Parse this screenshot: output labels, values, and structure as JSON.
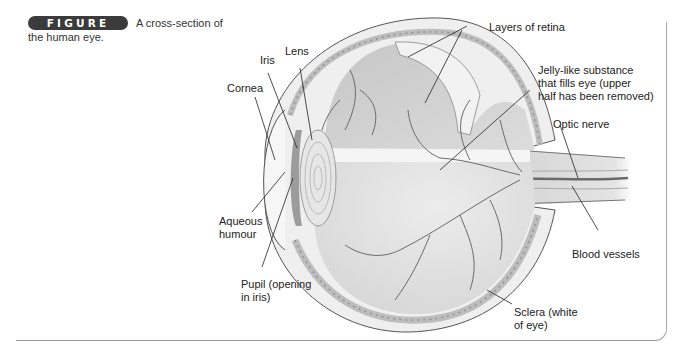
{
  "figure": {
    "badge": "FIGURE 5•7",
    "caption": "A cross-section of the human eye."
  },
  "labels": {
    "lens": "Lens",
    "iris": "Iris",
    "cornea": "Cornea",
    "layers_of_retina": "Layers of retina",
    "jelly_line1": "Jelly-like substance",
    "jelly_line2": "that fills eye (upper",
    "jelly_line3": "half has been removed)",
    "optic_nerve": "Optic nerve",
    "aqueous_line1": "Aqueous",
    "aqueous_line2": "humour",
    "pupil_line1": "Pupil (opening",
    "pupil_line2": "in iris)",
    "blood_vessels": "Blood vessels",
    "sclera_line1": "Sclera (white",
    "sclera_line2": "of eye)"
  },
  "colors": {
    "badge_bg": "#3b3b3b",
    "frame": "#9a9a9a",
    "eye_fill": "#d8d8d8",
    "vessels": "#6a6a6a"
  }
}
